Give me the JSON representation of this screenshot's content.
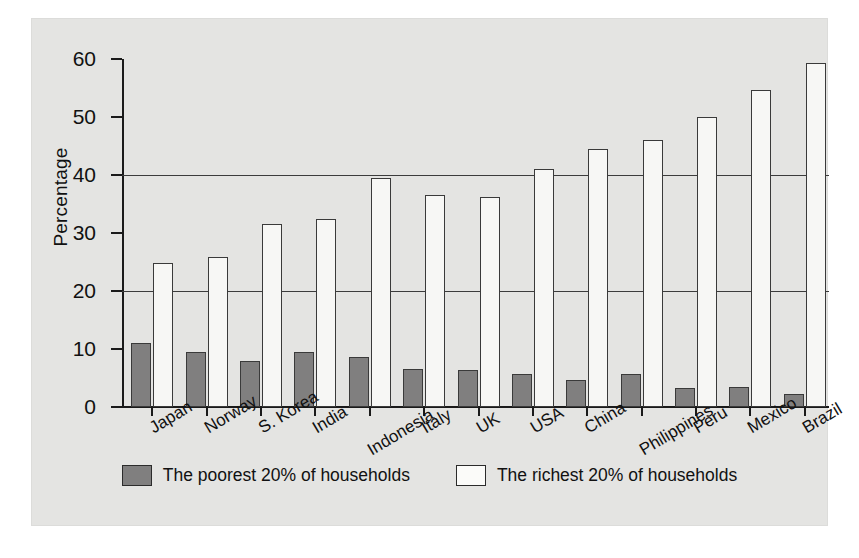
{
  "chart_data": {
    "type": "bar",
    "title": "",
    "subtitle": "",
    "xlabel": "",
    "ylabel": "Percentage",
    "ylim": [
      0,
      60
    ],
    "yticks": [
      0,
      10,
      20,
      30,
      40,
      50,
      60
    ],
    "ytick_labels": [
      "0",
      "10",
      "20",
      "30",
      "40",
      "50",
      "60"
    ],
    "gridlines": [
      20,
      40
    ],
    "grid": true,
    "legend_position": "bottom-center",
    "categories": [
      "Japan",
      "Norway",
      "S. Korea",
      "India",
      "Indonesia",
      "Italy",
      "UK",
      "USA",
      "China",
      "Philippines",
      "Peru",
      "Mexico",
      "Brazil"
    ],
    "series": [
      {
        "name": "The poorest 20% of households",
        "color": "#807f7f",
        "values": [
          11.0,
          9.5,
          8.0,
          9.4,
          8.6,
          6.5,
          6.4,
          5.7,
          4.7,
          5.7,
          3.3,
          3.5,
          2.3
        ]
      },
      {
        "name": "The richest 20% of households",
        "color": "#f7f7f5",
        "values": [
          24.9,
          25.9,
          31.6,
          32.5,
          39.4,
          36.6,
          36.2,
          41.0,
          44.5,
          46.0,
          50.0,
          54.7,
          59.3
        ]
      }
    ]
  },
  "legend": {
    "items": [
      {
        "label": "The poorest 20% of households",
        "swatch": "poor"
      },
      {
        "label": "The richest 20% of households",
        "swatch": "rich"
      }
    ]
  },
  "colors": {
    "panel_background": "#e4e4e2",
    "page_background": "#ffffff",
    "axis": "#1a1a1a",
    "gridline": "#3c3c3c",
    "poorest_bar": "#807f7f",
    "richest_bar": "#f7f7f5",
    "bar_outline": "#3a3a3a",
    "text": "#111111"
  }
}
